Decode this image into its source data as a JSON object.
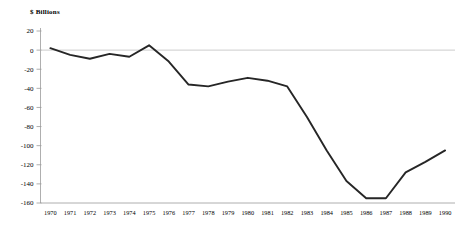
{
  "chart_data": {
    "type": "line",
    "title": "$ Billions",
    "xlabel": "",
    "ylabel": "$ Billions",
    "grid": false,
    "legend": "none",
    "zero_line": true,
    "ylim": [
      -160,
      20
    ],
    "yticks": [
      20,
      0,
      -20,
      -40,
      -60,
      -80,
      -100,
      -120,
      -140,
      -160
    ],
    "ytick_labels": [
      "20",
      "0",
      "-20",
      "-40",
      "-60",
      "-80",
      "-100",
      "-120",
      "-140",
      "-160"
    ],
    "categories": [
      "1970",
      "1971",
      "1972",
      "1973",
      "1974",
      "1975",
      "1976",
      "1977",
      "1978",
      "1979",
      "1980",
      "1981",
      "1982",
      "1983",
      "1984",
      "1985",
      "1986",
      "1987",
      "1988",
      "1989",
      "1990"
    ],
    "x": [
      1970,
      1971,
      1972,
      1973,
      1974,
      1975,
      1976,
      1977,
      1978,
      1979,
      1980,
      1981,
      1982,
      1983,
      1984,
      1985,
      1986,
      1987,
      1988,
      1989,
      1990
    ],
    "values": [
      2,
      -5,
      -9,
      -4,
      -7,
      5,
      -12,
      -36,
      -38,
      -33,
      -29,
      -32,
      -38,
      -70,
      -105,
      -137,
      -155,
      -155,
      -128,
      -117,
      -105
    ],
    "series": [
      {
        "name": "Deficit",
        "values": [
          2,
          -5,
          -9,
          -4,
          -7,
          5,
          -12,
          -36,
          -38,
          -33,
          -29,
          -32,
          -38,
          -70,
          -105,
          -137,
          -155,
          -155,
          -128,
          -117,
          -105
        ]
      }
    ],
    "line_color": "#262626",
    "axis_color": "#9a9a9a",
    "zero_line_color": "#c0c0c0"
  }
}
